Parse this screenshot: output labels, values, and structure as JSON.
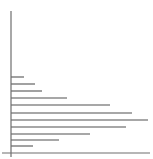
{
  "chart_data": {
    "type": "bar",
    "orientation": "horizontal",
    "title": "",
    "xlabel": "",
    "ylabel": "",
    "categories": [
      "1",
      "2",
      "3",
      "4",
      "5",
      "6",
      "7",
      "8",
      "9",
      "10",
      "11"
    ],
    "values": [
      13,
      24,
      31,
      56,
      99,
      121,
      137,
      115,
      79,
      48,
      22
    ],
    "xlim": [
      0,
      139
    ],
    "grid": false,
    "legend": null,
    "tick_labels_visible": false,
    "colors": {
      "bar": "#8a8a8a",
      "axis": "#6e6e6e",
      "background": "#ffffff"
    },
    "layout": {
      "axis_origin_x": 11,
      "axis_top_y": 11,
      "axis_bottom_y": 157,
      "x_axis_y": 153,
      "x_axis_start": 2,
      "x_axis_end": 150,
      "bar_y": [
        77,
        84,
        91,
        98,
        105,
        113,
        120,
        127,
        134,
        140,
        146
      ],
      "bar_thickness": 1.6
    }
  }
}
